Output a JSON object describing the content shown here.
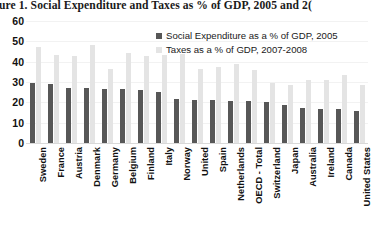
{
  "title": "gure 1. Social Expenditure and Taxes as % of GDP, 2005 and 2(",
  "chart_data": {
    "type": "bar",
    "title": "gure 1. Social Expenditure and Taxes as % of GDP, 2005 and 2(",
    "xlabel": "",
    "ylabel": "",
    "ylim": [
      0,
      60
    ],
    "yticks": [
      60,
      50,
      40,
      30,
      20,
      10,
      0
    ],
    "grid": true,
    "legend_position": "top-right",
    "categories": [
      "Sweden",
      "France",
      "Austria",
      "Denmark",
      "Germany",
      "Belgium",
      "Finland",
      "Italy",
      "Norway",
      "United",
      "Spain",
      "Netherlands",
      "OECD - Total",
      "Switzerland",
      "Japan",
      "Australia",
      "Ireland",
      "Canada",
      "United States"
    ],
    "series": [
      {
        "name": "Social Expenditure as a % of GDP, 2005",
        "color": "#575757",
        "values": [
          29.4,
          29.2,
          27.2,
          27.1,
          26.7,
          26.4,
          26.1,
          25.0,
          21.6,
          21.3,
          21.2,
          20.9,
          20.5,
          20.3,
          18.6,
          17.1,
          16.7,
          16.5,
          15.9
        ]
      },
      {
        "name": "Taxes as a % of GDP, 2007-2008",
        "color": "#e4e4e4",
        "values": [
          47.1,
          43.5,
          42.9,
          48.3,
          36.2,
          44.4,
          43.0,
          43.3,
          43.6,
          36.6,
          37.2,
          39.1,
          35.8,
          29.7,
          28.3,
          30.8,
          30.8,
          33.3,
          28.3
        ]
      }
    ]
  },
  "y_axis": {
    "ticks": [
      "60",
      "50",
      "40",
      "30",
      "20",
      "10",
      "0"
    ]
  },
  "legend": {
    "items": [
      {
        "label": "Social Expenditure as a % of GDP, 2005"
      },
      {
        "label": "Taxes as a % of GDP, 2007-2008"
      }
    ]
  }
}
